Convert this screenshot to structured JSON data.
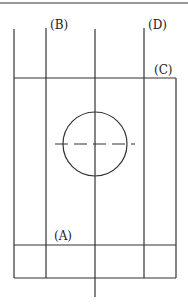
{
  "diagram": {
    "type": "section-plan",
    "labels": {
      "A": "(A)",
      "B": "(B)",
      "C": "(C)",
      "D": "(D)"
    },
    "colors": {
      "stroke": "#333333",
      "background": "#ffffff"
    }
  }
}
